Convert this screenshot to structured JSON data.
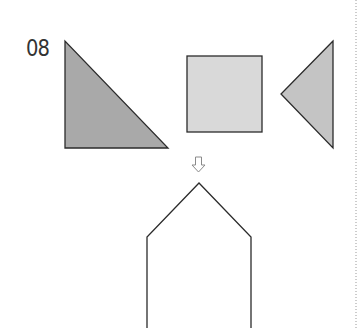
{
  "problem": {
    "number": "08"
  },
  "pieces": [
    {
      "name": "right-triangle",
      "fill": "#a9a9a9",
      "points": "65,41 65,148 168,148"
    },
    {
      "name": "square",
      "fill": "#d9d9d9",
      "x": 187,
      "y": 56,
      "width": 75,
      "height": 76
    },
    {
      "name": "left-pointing-triangle",
      "fill": "#c4c4c4",
      "points": "333,41 281,94 333,148"
    }
  ],
  "arrow": {
    "symbol": "down-arrow-outline"
  },
  "target_shape": {
    "name": "house-pentagon",
    "points": "147,328 147,237 199,183 251,237 251,328"
  },
  "colors": {
    "stroke": "#2b2b2b",
    "divider": "#999999"
  }
}
